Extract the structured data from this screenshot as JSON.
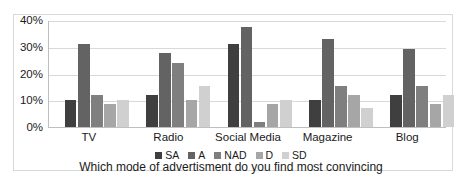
{
  "chart_data": {
    "type": "bar",
    "title": "",
    "xlabel": "Which mode of advertisment do you find most convincing",
    "ylabel": "",
    "categories": [
      "TV",
      "Radio",
      "Social Media",
      "Magazine",
      "Blog"
    ],
    "ylim": [
      0,
      40
    ],
    "ytick_labels": [
      "0%",
      "10%",
      "20%",
      "30%",
      "40%"
    ],
    "ytick_values": [
      0,
      10,
      20,
      30,
      40
    ],
    "grid": true,
    "legend_position": "bottom",
    "series": [
      {
        "name": "SA",
        "color": "#3f3f3f",
        "values": [
          10,
          12,
          31,
          10,
          12
        ]
      },
      {
        "name": "A",
        "color": "#636363",
        "values": [
          31,
          27.5,
          37.5,
          33,
          29
        ]
      },
      {
        "name": "NAD",
        "color": "#7f7f7f",
        "values": [
          12,
          24,
          2,
          15.5,
          15.5
        ]
      },
      {
        "name": "D",
        "color": "#a6a6a6",
        "values": [
          8.5,
          10,
          8.5,
          12,
          8.5
        ]
      },
      {
        "name": "SD",
        "color": "#d0d0d0",
        "values": [
          10,
          15.5,
          10,
          7,
          12
        ]
      }
    ]
  }
}
